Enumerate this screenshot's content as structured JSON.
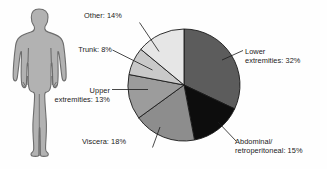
{
  "figure": {
    "width": 327,
    "height": 169,
    "background": "#fefefe"
  },
  "human_figure": {
    "name": "human-body-silhouette",
    "fill": "#b2b2b2",
    "stroke": "#6d6d6d",
    "description": "Front-facing adult human body outline"
  },
  "chart_data": {
    "type": "pie",
    "title": "",
    "xlabel": "",
    "ylabel": "",
    "start_angle_deg": 0,
    "direction": "clockwise",
    "legend": "none",
    "grid": false,
    "center": [
      58,
      58
    ],
    "radius": 56,
    "categories": [
      "Lower extremities",
      "Abdominal/ retroperitoneal",
      "Viscera",
      "Upper extremities",
      "Trunk",
      "Other"
    ],
    "values": [
      32,
      15,
      18,
      13,
      8,
      14
    ],
    "unit": "%",
    "colors": [
      "#5c5c5c",
      "#0d0d0d",
      "#8d8d8d",
      "#9c9c9c",
      "#c9c9c9",
      "#e6e6e6"
    ],
    "slice_stroke": "#1a1a1a",
    "slices": [
      {
        "label": "Lower extremities",
        "value": 32,
        "color": "#5c5c5c",
        "start_deg": 0.0,
        "end_deg": 115.2
      },
      {
        "label": "Abdominal/ retroperitoneal",
        "value": 15,
        "color": "#0d0d0d",
        "start_deg": 115.2,
        "end_deg": 169.2
      },
      {
        "label": "Viscera",
        "value": 18,
        "color": "#8d8d8d",
        "start_deg": 169.2,
        "end_deg": 234.0
      },
      {
        "label": "Upper extremities",
        "value": 13,
        "color": "#9c9c9c",
        "start_deg": 234.0,
        "end_deg": 280.8
      },
      {
        "label": "Trunk",
        "value": 8,
        "color": "#c9c9c9",
        "start_deg": 280.8,
        "end_deg": 309.6
      },
      {
        "label": "Other",
        "value": 14,
        "color": "#e6e6e6",
        "start_deg": 309.6,
        "end_deg": 360.0
      }
    ]
  },
  "labels": {
    "other": "Other: 14%",
    "trunk": "Trunk: 8%",
    "upper": "Upper\nextremities: 13%",
    "viscera": "Viscera: 18%",
    "lower": "Lower\nextremities: 32%",
    "abdominal": "Abdominal/\nretroperitoneal: 15%"
  }
}
